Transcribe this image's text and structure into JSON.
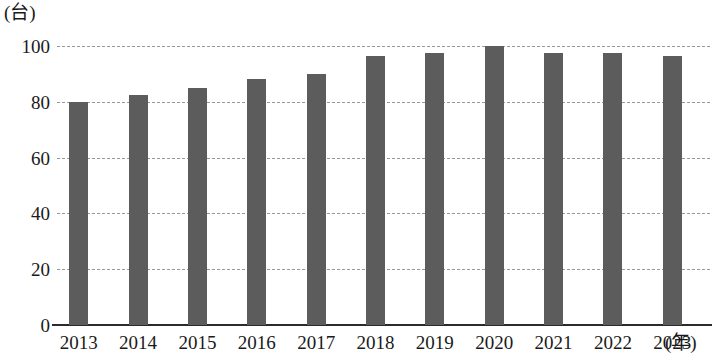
{
  "chart_data": {
    "type": "bar",
    "title": "",
    "subtitle": "",
    "xlabel": "(年)",
    "ylabel": "(台)",
    "categories": [
      "2013",
      "2014",
      "2015",
      "2016",
      "2017",
      "2018",
      "2019",
      "2020",
      "2021",
      "2022",
      "2023"
    ],
    "values": [
      80,
      82.5,
      85,
      88,
      90,
      96.5,
      97.5,
      100,
      97.5,
      97.5,
      96.5
    ],
    "series": [
      {
        "name": "",
        "values": [
          80,
          82.5,
          85,
          88,
          90,
          96.5,
          97.5,
          100,
          97.5,
          97.5,
          96.5
        ]
      }
    ],
    "ylim": [
      0,
      100
    ],
    "yticks": [
      0,
      20,
      40,
      60,
      80,
      100
    ],
    "ytick_labels": [
      "0",
      "20",
      "40",
      "60",
      "80",
      "100"
    ],
    "grid": true,
    "grid_style": "dashed-horizontal",
    "legend": false,
    "legend_position": "none",
    "bar_color": "#5c5c5c",
    "grid_color": "#9a9a9a",
    "axis_color": "#2b2b2b",
    "background_color": "#ffffff"
  }
}
